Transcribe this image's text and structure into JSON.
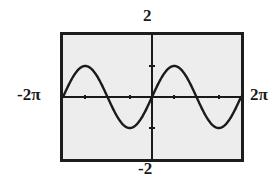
{
  "figure": {
    "name": "graphing-calculator-sine-plot",
    "frame": {
      "border_color": "#1d1d1d",
      "background_color": "#ededed"
    },
    "labels": {
      "top": "2",
      "bottom": "-2",
      "left": "-2π",
      "right": "2π"
    }
  },
  "chart_data": {
    "type": "line",
    "title": "",
    "xlabel": "",
    "ylabel": "",
    "xlim": [
      -6.283185,
      6.283185
    ],
    "ylim": [
      -2,
      2
    ],
    "xlim_labels": [
      "-2π",
      "2π"
    ],
    "ylim_labels": [
      "-2",
      "2"
    ],
    "grid": false,
    "x_axis_visible": true,
    "y_axis_visible": true,
    "x_tick_values": [
      -4.712389,
      -1.570796,
      1.570796,
      4.712389
    ],
    "x_tick_labels": [
      "",
      "",
      "",
      ""
    ],
    "y_tick_values": [
      -1,
      1
    ],
    "y_tick_labels": [
      "",
      ""
    ],
    "x_tick_interval": 1.570796,
    "y_tick_interval": 1,
    "series": [
      {
        "name": "y = sin(x)",
        "color": "#1a1a1a",
        "function": "sin(x)",
        "amplitude": 1,
        "period": 6.283185,
        "x": [
          -6.283185,
          -5.890486,
          -5.497787,
          -5.105088,
          -4.712389,
          -4.31969,
          -3.926991,
          -3.534292,
          -3.141593,
          -2.748894,
          -2.356194,
          -1.963495,
          -1.570796,
          -1.178097,
          -0.785398,
          -0.392699,
          0.0,
          0.392699,
          0.785398,
          1.178097,
          1.570796,
          1.963495,
          2.356194,
          2.748894,
          3.141593,
          3.534292,
          3.926991,
          4.31969,
          4.712389,
          5.105088,
          5.497787,
          5.890486,
          6.283185
        ],
        "y": [
          0.0,
          0.382683,
          0.707107,
          0.92388,
          1.0,
          0.92388,
          0.707107,
          0.382683,
          0.0,
          -0.382683,
          -0.707107,
          -0.92388,
          -1.0,
          -0.92388,
          -0.707107,
          -0.382683,
          0.0,
          0.382683,
          0.707107,
          0.92388,
          1.0,
          0.92388,
          0.707107,
          0.382683,
          0.0,
          -0.382683,
          -0.707107,
          -0.92388,
          -1.0,
          -0.92388,
          -0.707107,
          -0.382683,
          0.0
        ]
      }
    ],
    "legend": null,
    "annotations": [
      {
        "text": "2",
        "position": "above-y-axis",
        "meaning": "y-axis maximum"
      },
      {
        "text": "-2",
        "position": "below-y-axis",
        "meaning": "y-axis minimum"
      },
      {
        "text": "-2π",
        "position": "left-of-x-axis",
        "meaning": "x-axis minimum"
      },
      {
        "text": "2π",
        "position": "right-of-x-axis",
        "meaning": "x-axis maximum"
      }
    ]
  }
}
